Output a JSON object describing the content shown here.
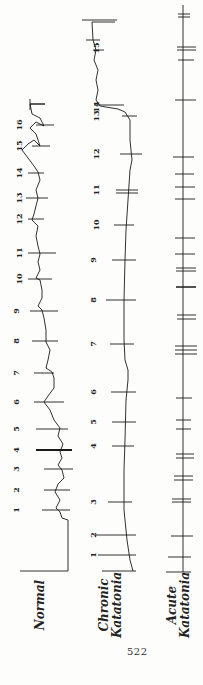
{
  "figure": {
    "traces": [
      {
        "name": "Normal",
        "label_lines": [
          "Normal"
        ],
        "marks": [
          "1",
          "2",
          "3",
          "4",
          "5",
          "6",
          "7",
          "8",
          "9",
          "10",
          "11",
          "12",
          "13",
          "14",
          "15",
          "16"
        ],
        "mark_y": [
          510,
          490,
          469,
          450,
          429,
          402,
          373,
          341,
          311,
          279,
          253,
          219,
          198,
          173,
          146,
          125
        ]
      },
      {
        "name": "Chronic Katatonia",
        "label_lines": [
          "Chronic",
          "Katatonia"
        ],
        "marks": [
          "1",
          "2",
          "3",
          "4",
          "5",
          "6",
          "7",
          "8",
          "9",
          "10",
          "11",
          "12",
          "13",
          "14",
          "15"
        ],
        "mark_y": [
          555,
          535,
          502,
          446,
          422,
          392,
          344,
          300,
          260,
          225,
          190,
          154,
          116,
          107,
          48
        ]
      },
      {
        "name": "Acute Katatonia",
        "label_lines": [
          "Acute",
          "Katatonia"
        ],
        "marks": []
      }
    ],
    "page_number": "522"
  }
}
